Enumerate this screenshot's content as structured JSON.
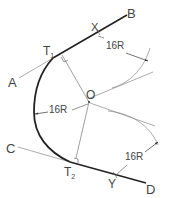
{
  "diagram": {
    "points": {
      "A": "A",
      "B": "B",
      "C": "C",
      "D": "D",
      "O": "O",
      "T1_main": "T",
      "T1_sub": "1",
      "T2_main": "T",
      "T2_sub": "2",
      "X": "X",
      "Y": "Y"
    },
    "dimensions": {
      "radius_top": "16R",
      "radius_left": "16R",
      "radius_bottom": "16R"
    },
    "colors": {
      "heavy_line": "#222222",
      "thin_line": "#777777",
      "text": "#444444"
    }
  }
}
